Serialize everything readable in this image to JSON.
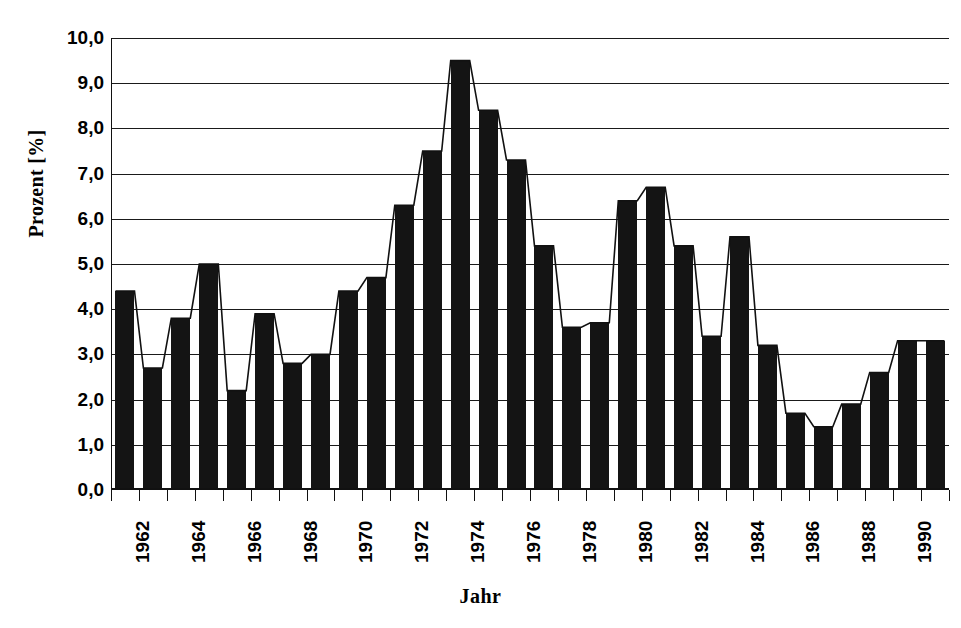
{
  "chart_data": {
    "type": "bar",
    "title": "",
    "xlabel": "Jahr",
    "ylabel": "Prozent [%]",
    "ylim": [
      0,
      10
    ],
    "ytick_labels": [
      "10,0",
      "9,0",
      "8,0",
      "7,0",
      "6,0",
      "5,0",
      "4,0",
      "3,0",
      "2,0",
      "1,0",
      "0,0"
    ],
    "ytick_values": [
      10,
      9,
      8,
      7,
      6,
      5,
      4,
      3,
      2,
      1,
      0
    ],
    "grid": "horizontal",
    "legend": "none",
    "decimal_separator": ",",
    "categories": [
      "1962",
      "1963",
      "1964",
      "1965",
      "1966",
      "1967",
      "1968",
      "1969",
      "1970",
      "1971",
      "1972",
      "1973",
      "1974",
      "1975",
      "1976",
      "1977",
      "1978",
      "1979",
      "1980",
      "1981",
      "1982",
      "1983",
      "1984",
      "1985",
      "1986",
      "1987",
      "1988",
      "1989",
      "1990",
      "1991"
    ],
    "xtick_labels_shown": [
      "1962",
      "1964",
      "1966",
      "1968",
      "1970",
      "1972",
      "1974",
      "1976",
      "1978",
      "1980",
      "1982",
      "1984",
      "1986",
      "1988",
      "1990"
    ],
    "values": [
      4.4,
      2.7,
      3.8,
      5.0,
      2.2,
      3.9,
      2.8,
      3.0,
      4.4,
      4.7,
      6.3,
      7.5,
      9.5,
      8.4,
      7.3,
      5.4,
      3.6,
      3.7,
      6.4,
      6.7,
      5.4,
      3.4,
      5.6,
      3.2,
      1.7,
      1.4,
      1.9,
      2.6,
      3.3,
      3.3
    ],
    "series": [
      {
        "name": "Prozent",
        "render": "bar-with-line-overlay",
        "color": "#141414",
        "values": [
          4.4,
          2.7,
          3.8,
          5.0,
          2.2,
          3.9,
          2.8,
          3.0,
          4.4,
          4.7,
          6.3,
          7.5,
          9.5,
          8.4,
          7.3,
          5.4,
          3.6,
          3.7,
          6.4,
          6.7,
          5.4,
          3.4,
          5.6,
          3.2,
          1.7,
          1.4,
          1.9,
          2.6,
          3.3,
          3.3
        ]
      }
    ],
    "max_value": 9.5,
    "max_category": "1974",
    "min_value": 1.4,
    "min_category": "1987"
  },
  "colors": {
    "bar": "#141414",
    "axis": "#111111",
    "grid": "#1a1a1a",
    "background": "#ffffff",
    "title_faded": "#c9c9cf"
  },
  "axes": {
    "y_title": "Prozent [%]",
    "x_title": "Jahr"
  },
  "header": {
    "cropped_title": ""
  }
}
